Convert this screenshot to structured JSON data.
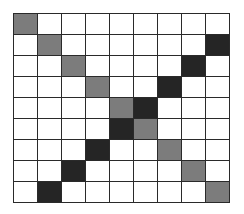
{
  "grid": {
    "rows": 9,
    "cols": 9,
    "colors": {
      "empty": "#ffffff",
      "gray": "#7c7c7c",
      "dark": "#252525",
      "line": "#2a2a2a"
    },
    "cells": [
      [
        "gray",
        "empty",
        "empty",
        "empty",
        "empty",
        "empty",
        "empty",
        "empty",
        "empty"
      ],
      [
        "empty",
        "gray",
        "empty",
        "empty",
        "empty",
        "empty",
        "empty",
        "empty",
        "dark"
      ],
      [
        "empty",
        "empty",
        "gray",
        "empty",
        "empty",
        "empty",
        "empty",
        "dark",
        "empty"
      ],
      [
        "empty",
        "empty",
        "empty",
        "gray",
        "empty",
        "empty",
        "dark",
        "empty",
        "empty"
      ],
      [
        "empty",
        "empty",
        "empty",
        "empty",
        "gray",
        "dark",
        "empty",
        "empty",
        "empty"
      ],
      [
        "empty",
        "empty",
        "empty",
        "empty",
        "dark",
        "gray",
        "empty",
        "empty",
        "empty"
      ],
      [
        "empty",
        "empty",
        "empty",
        "dark",
        "empty",
        "empty",
        "gray",
        "empty",
        "empty"
      ],
      [
        "empty",
        "empty",
        "dark",
        "empty",
        "empty",
        "empty",
        "empty",
        "gray",
        "empty"
      ],
      [
        "empty",
        "dark",
        "empty",
        "empty",
        "empty",
        "empty",
        "empty",
        "empty",
        "gray"
      ]
    ]
  }
}
